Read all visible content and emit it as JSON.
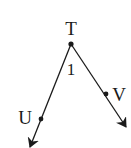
{
  "diagram": {
    "type": "geometry-angle",
    "vertex": {
      "label": "T",
      "x": 71,
      "y": 44
    },
    "angle_label": {
      "text": "1",
      "x": 71,
      "y": 73
    },
    "rays": [
      {
        "name": "TU",
        "point": {
          "label": "U",
          "x": 41,
          "y": 119
        },
        "tip": {
          "x": 30,
          "y": 147
        },
        "label_pos": {
          "x": 25,
          "y": 122
        }
      },
      {
        "name": "TV",
        "point": {
          "label": "V",
          "x": 106,
          "y": 94
        },
        "tip": {
          "x": 126,
          "y": 127
        },
        "label_pos": {
          "x": 119,
          "y": 99
        }
      }
    ],
    "stroke_color": "#1a1a1a",
    "background": "#ffffff"
  }
}
